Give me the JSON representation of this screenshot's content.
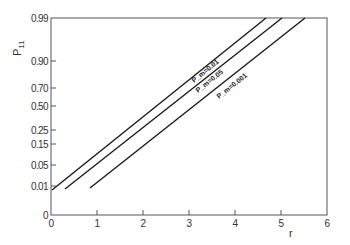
{
  "chart_data": {
    "type": "line",
    "title": "",
    "xlabel": "r",
    "ylabel": "P_11",
    "xlim": [
      0,
      6
    ],
    "ylim": [
      0,
      0.99
    ],
    "y_scale": "probability (non-linear)",
    "grid": false,
    "x_ticks": [
      "0",
      "1",
      "2",
      "3",
      "4",
      "5",
      "6"
    ],
    "y_ticks": [
      "0",
      "0.01",
      "0.05",
      "0.15",
      "0.25",
      "0.50",
      "0.70",
      "0.90",
      "0.99"
    ],
    "series": [
      {
        "name": "P_m = 0.01",
        "label": "P_m=0.01",
        "x": [
          0.02,
          4.67
        ],
        "y": [
          0.008,
          0.99
        ]
      },
      {
        "name": "P_m = 0.05",
        "label": "P_m=0.05",
        "x": [
          0.3,
          5.02
        ],
        "y": [
          0.008,
          0.99
        ]
      },
      {
        "name": "P_m = 0.001",
        "label": "P_m=0.001",
        "x": [
          0.85,
          5.52
        ],
        "y": [
          0.009,
          0.99
        ]
      }
    ],
    "legend": "inline labels along lines"
  },
  "layout": {
    "plot_left": 51,
    "plot_right": 327,
    "plot_top": 18,
    "plot_bottom": 215,
    "y_tick_pixels": {
      "0": 215,
      "0.01": 186,
      "0.05": 165,
      "0.15": 144,
      "0.25": 130,
      "0.50": 106,
      "0.70": 88,
      "0.90": 61,
      "0.99": 18
    },
    "line_pixels": [
      {
        "x1": 52,
        "y1": 190,
        "x2": 266,
        "y2": 18
      },
      {
        "x1": 65,
        "y1": 189,
        "x2": 282,
        "y2": 18
      },
      {
        "x1": 90,
        "y1": 188,
        "x2": 305,
        "y2": 18
      }
    ]
  },
  "colors": {
    "line": "#1a1a1a",
    "axis": "#555555",
    "background": "#ffffff"
  }
}
